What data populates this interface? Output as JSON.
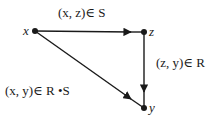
{
  "diagram": {
    "nodes": [
      {
        "id": "x",
        "label": "x"
      },
      {
        "id": "z",
        "label": "z"
      },
      {
        "id": "y",
        "label": "y"
      }
    ],
    "edges": [
      {
        "from": "x",
        "to": "z",
        "label": "(x, z)∈ S"
      },
      {
        "from": "z",
        "to": "y",
        "label": "(z, y)∈ R"
      },
      {
        "from": "x",
        "to": "y",
        "label": "(x, y)∈ R •S"
      }
    ],
    "colors": {
      "stroke": "#1a1a1a",
      "background": "#ffffff"
    }
  }
}
